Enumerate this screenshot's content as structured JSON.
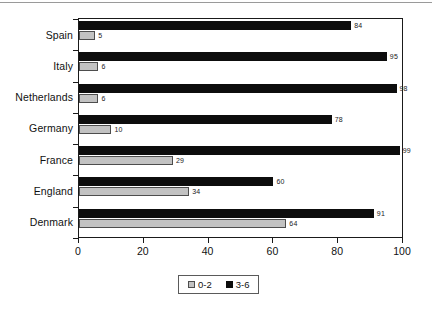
{
  "chart_data": {
    "type": "bar",
    "orientation": "horizontal",
    "title": "",
    "xlabel": "",
    "ylabel": "",
    "xlim": [
      0,
      100
    ],
    "xticks": [
      0,
      20,
      40,
      60,
      80,
      100
    ],
    "grid": false,
    "legend_position": "bottom-center",
    "categories": [
      "Spain",
      "Italy",
      "Netherlands",
      "Germany",
      "France",
      "England",
      "Denmark"
    ],
    "series": [
      {
        "name": "0-2",
        "color": "#c2c2c2",
        "values": [
          5,
          6,
          6,
          10,
          29,
          34,
          64
        ]
      },
      {
        "name": "3-6",
        "color": "#0d0d0d",
        "values": [
          84,
          95,
          98,
          78,
          99,
          60,
          91
        ]
      }
    ]
  },
  "legend": {
    "items": [
      {
        "label": "0-2",
        "swatch": "gray-swatch"
      },
      {
        "label": "3-6",
        "swatch": "black-swatch"
      }
    ]
  },
  "axis": {
    "x_tick_labels": [
      "0",
      "20",
      "40",
      "60",
      "80",
      "100"
    ]
  }
}
